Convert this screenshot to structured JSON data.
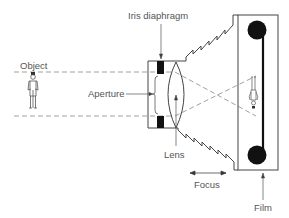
{
  "diagram": {
    "type": "camera-optics-schematic",
    "labels": {
      "iris": "Iris diaphragm",
      "object": "Object",
      "aperture": "Aperture",
      "lens": "Lens",
      "focus": "Focus",
      "film": "Film"
    },
    "colors": {
      "line": "#444444",
      "dash": "#888888",
      "fill": "#111111",
      "text": "#555555"
    }
  }
}
